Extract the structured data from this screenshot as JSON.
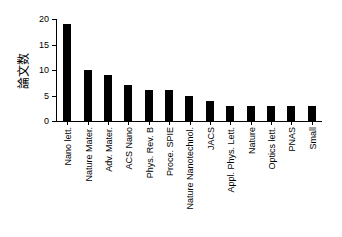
{
  "chart_data": {
    "type": "bar",
    "title": "",
    "subtitle": "",
    "xlabel": "",
    "ylabel": "論文数",
    "categories": [
      "Nano lett.",
      "Nature Mater.",
      "Adv. Mater.",
      "ACS Nano",
      "Phys. Rev. B",
      "Proce. SPIE",
      "Nature Nanotechnol.",
      "JACS",
      "Appl. Phys. Lett.",
      "Nature",
      "Optics lett.",
      "PNAS",
      "Small"
    ],
    "values": [
      19,
      10,
      9,
      7,
      6,
      6,
      5,
      4,
      3,
      3,
      3,
      3,
      3
    ],
    "ylim": [
      0,
      20
    ],
    "yticks": [
      0,
      5,
      10,
      15,
      20
    ],
    "ytick_labels": [
      "0",
      "5",
      "10",
      "15",
      "20"
    ],
    "grid": false,
    "legend": false,
    "bar_color": "#000000",
    "axis_color": "#000000",
    "background": "#ffffff"
  }
}
